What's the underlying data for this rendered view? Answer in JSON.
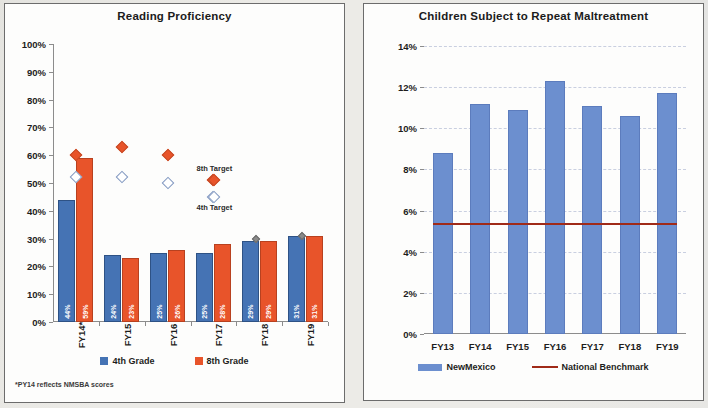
{
  "document": {
    "background_color": "#ecebe7",
    "panel_background": "#fdfdfc"
  },
  "charts": [
    {
      "panel_name": "reading-proficiency-panel",
      "title": "Reading Proficiency",
      "footnote": "*PY14 reflects NMSBA scores",
      "legend": [
        {
          "label": "4th Grade",
          "color": "#4573b4",
          "shape": "square"
        },
        {
          "label": "8th Grade",
          "color": "#e8542a",
          "shape": "square"
        }
      ],
      "annotations": [
        {
          "label": "8th Target",
          "x_index": 3.52,
          "y": 55
        },
        {
          "label": "4th Target",
          "x_index": 3.52,
          "y": 41
        }
      ]
    },
    {
      "panel_name": "repeat-maltreatment-panel",
      "title": "Children Subject to Repeat Maltreatment",
      "legend": [
        {
          "label": "NewMexico",
          "color": "#6c8fcf",
          "shape": "bar"
        },
        {
          "label": "National Benchmark",
          "color": "#a02a18",
          "shape": "line"
        }
      ]
    }
  ],
  "chart_data": [
    {
      "type": "bar",
      "title": "Reading Proficiency",
      "xlabel": "",
      "ylabel": "",
      "ylim": [
        0,
        100
      ],
      "yticks": [
        "0%",
        "10%",
        "20%",
        "30%",
        "40%",
        "50%",
        "60%",
        "70%",
        "80%",
        "90%",
        "100%"
      ],
      "ytick_values": [
        0,
        10,
        20,
        30,
        40,
        50,
        60,
        70,
        80,
        90,
        100
      ],
      "grid": false,
      "legend_position": "bottom",
      "categories": [
        "FY14*",
        "FY15",
        "FY16",
        "FY17",
        "FY18",
        "FY19"
      ],
      "series": [
        {
          "name": "4th Grade",
          "type": "bar",
          "color": "#4573b4",
          "values": [
            44,
            24,
            25,
            25,
            29,
            31
          ],
          "data_labels": [
            "44%",
            "24%",
            "25%",
            "25%",
            "29%",
            "31%"
          ]
        },
        {
          "name": "8th Grade",
          "type": "bar",
          "color": "#e8542a",
          "values": [
            59,
            23,
            26,
            28,
            29,
            31
          ],
          "data_labels": [
            "59%",
            "23%",
            "26%",
            "28%",
            "29%",
            "31%"
          ]
        },
        {
          "name": "8th Target",
          "type": "scatter",
          "marker": "filled-diamond",
          "color": "#e8542a",
          "values": [
            60,
            63,
            60,
            51,
            null,
            null
          ]
        },
        {
          "name": "4th Target",
          "type": "scatter",
          "marker": "open-diamond",
          "color": "#ffffff",
          "values": [
            52,
            52,
            50,
            45,
            null,
            null
          ]
        },
        {
          "name": "Marker Overlay",
          "type": "scatter",
          "marker": "small-diamond",
          "color": "#8a8a8a",
          "values": [
            null,
            null,
            null,
            null,
            30,
            31
          ]
        }
      ],
      "footnote": "*PY14 reflects NMSBA scores"
    },
    {
      "type": "bar",
      "title": "Children Subject to Repeat Maltreatment",
      "xlabel": "",
      "ylabel": "",
      "ylim": [
        0,
        14
      ],
      "yticks": [
        "0%",
        "2%",
        "4%",
        "6%",
        "8%",
        "10%",
        "12%",
        "14%"
      ],
      "ytick_values": [
        0,
        2,
        4,
        6,
        8,
        10,
        12,
        14
      ],
      "grid": true,
      "legend_position": "bottom",
      "categories": [
        "FY13",
        "FY14",
        "FY15",
        "FY16",
        "FY17",
        "FY18",
        "FY19"
      ],
      "series": [
        {
          "name": "NewMexico",
          "type": "bar",
          "color": "#6c8fcf",
          "values": [
            8.8,
            11.2,
            10.9,
            12.3,
            11.1,
            10.6,
            11.7
          ]
        },
        {
          "name": "National Benchmark",
          "type": "line",
          "color": "#a02a18",
          "value": 5.4,
          "values": [
            5.4,
            5.4,
            5.4,
            5.4,
            5.4,
            5.4,
            5.4
          ]
        }
      ]
    }
  ]
}
